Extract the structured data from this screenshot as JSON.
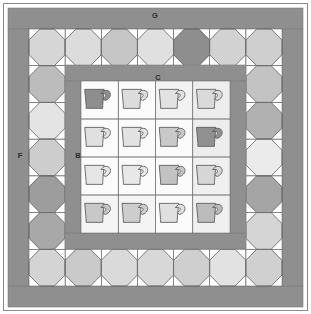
{
  "diagram": {
    "width": 311,
    "height": 314,
    "background_color": "#ffffff"
  },
  "labels": [
    {
      "id": "G",
      "text": "G",
      "part": "outer-top-border",
      "x": 155,
      "y": 16
    },
    {
      "id": "F",
      "text": "F",
      "part": "outer-left-border",
      "x": 20,
      "y": 156
    },
    {
      "id": "C",
      "text": "C",
      "part": "inner-top-border",
      "x": 158,
      "y": 78
    },
    {
      "id": "B",
      "text": "B",
      "part": "inner-left-border",
      "x": 78,
      "y": 156
    }
  ],
  "colors": {
    "background": "#ffffff",
    "outer_border": "#8f8f8f",
    "inner_border": "#8f8f8f",
    "outline": "#4a4a4a",
    "seam_line": "#6e6e6e",
    "block_background": "#ffffff",
    "cup_outline": "#5a5a5a",
    "shade_dark": "#8e8e8e",
    "shade_mid": "#b4b4b4",
    "shade_light": "#cccccc",
    "shade_lighter": "#dcdcdc",
    "shade_lightest": "#ebebeb"
  },
  "outer_border": {
    "name": "outer-sashing-border",
    "label_top": "G",
    "label_left": "F",
    "color": "#8f8f8f",
    "thickness_px": 20
  },
  "inner_border": {
    "name": "inner-sashing-border",
    "label_top": "C",
    "label_left": "B",
    "color": "#8f8f8f",
    "thickness_px": 16
  },
  "snowball_border": {
    "name": "snowball-block-border",
    "rows": 7,
    "cols": 7,
    "block_size_px": 33.3,
    "top_row_shades": [
      "#d6d6d6",
      "#dcdcdc",
      "#c6c6c6",
      "#e0e0e0",
      "#8e8e8e",
      "#d2d2d2",
      "#cfcfcf"
    ],
    "bottom_row_shades": [
      "#d4d4d4",
      "#cacaca",
      "#dadada",
      "#d8d8d8",
      "#cfcfcf",
      "#e2e2e2",
      "#d0d0d0"
    ],
    "left_col_shades": [
      "#d6d6d6",
      "#bcbcbc",
      "#e4e4e4",
      "#cdcdcd",
      "#9d9d9d",
      "#a8a8a8",
      "#d4d4d4"
    ],
    "right_col_shades": [
      "#cfcfcf",
      "#c3c3c3",
      "#b1b1b1",
      "#ebebeb",
      "#a5a5a5",
      "#d5d5d5",
      "#d0d0d0"
    ]
  },
  "cup_grid": {
    "name": "teacup-block-grid",
    "rows": 4,
    "cols": 4,
    "total_blocks": 16,
    "cells": [
      {
        "row": 1,
        "col": 1,
        "cup_shade": "#8e8e8e",
        "block_bg": "#fbfbfb"
      },
      {
        "row": 1,
        "col": 2,
        "cup_shade": "#dcdcdc",
        "block_bg": "#fbfbfb"
      },
      {
        "row": 1,
        "col": 3,
        "cup_shade": "#e2e2e2",
        "block_bg": "#f2f2f2"
      },
      {
        "row": 1,
        "col": 4,
        "cup_shade": "#dadada",
        "block_bg": "#ededed"
      },
      {
        "row": 2,
        "col": 1,
        "cup_shade": "#e0e0e0",
        "block_bg": "#fbfbfb"
      },
      {
        "row": 2,
        "col": 2,
        "cup_shade": "#e2e2e2",
        "block_bg": "#fbfbfb"
      },
      {
        "row": 2,
        "col": 3,
        "cup_shade": "#c9c9c9",
        "block_bg": "#fbfbfb"
      },
      {
        "row": 2,
        "col": 4,
        "cup_shade": "#919191",
        "block_bg": "#ededed"
      },
      {
        "row": 3,
        "col": 1,
        "cup_shade": "#e6e6e6",
        "block_bg": "#fbfbfb"
      },
      {
        "row": 3,
        "col": 2,
        "cup_shade": "#e8e8e8",
        "block_bg": "#fbfbfb"
      },
      {
        "row": 3,
        "col": 3,
        "cup_shade": "#c2c2c2",
        "block_bg": "#fbfbfb"
      },
      {
        "row": 3,
        "col": 4,
        "cup_shade": "#d6d6d6",
        "block_bg": "#f0f0f0"
      },
      {
        "row": 4,
        "col": 1,
        "cup_shade": "#c8c8c8",
        "block_bg": "#f4f4f4"
      },
      {
        "row": 4,
        "col": 2,
        "cup_shade": "#cdcdcd",
        "block_bg": "#f4f4f4"
      },
      {
        "row": 4,
        "col": 3,
        "cup_shade": "#e0e0e0",
        "block_bg": "#fbfbfb"
      },
      {
        "row": 4,
        "col": 4,
        "cup_shade": "#bcbcbc",
        "block_bg": "#f0f0f0"
      }
    ]
  }
}
